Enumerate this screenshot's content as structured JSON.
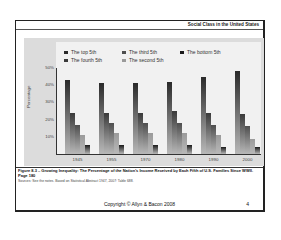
{
  "header": {
    "title": "Social Class in the United States"
  },
  "chart_data": {
    "type": "bar",
    "title": "",
    "xlabel": "",
    "ylabel": "Percentage",
    "ylim": [
      0,
      50
    ],
    "yticks": [
      "10%",
      "20%",
      "30%",
      "40%",
      "50%"
    ],
    "categories": [
      "1945",
      "1955",
      "1970",
      "1980",
      "1990",
      "2000"
    ],
    "legend_position": "top",
    "series": [
      {
        "name": "The top 5th",
        "color": "#2a2a2a",
        "values": [
          43,
          41,
          41,
          42,
          45,
          48
        ]
      },
      {
        "name": "The fourth 5th",
        "color": "#3a3a3a",
        "values": [
          24,
          24,
          24,
          25,
          24,
          23
        ]
      },
      {
        "name": "The third 5th",
        "color": "#4e4e4e",
        "values": [
          17,
          18,
          18,
          18,
          17,
          16
        ]
      },
      {
        "name": "The second 5th",
        "color": "#9a9a9a",
        "values": [
          11,
          12,
          12,
          12,
          11,
          9
        ]
      },
      {
        "name": "The bottom 5th",
        "color": "#1a1a1a",
        "values": [
          5,
          5,
          5,
          5,
          4,
          4
        ]
      }
    ]
  },
  "legend": [
    {
      "label": "The top 5th",
      "color": "#2a2a2a"
    },
    {
      "label": "The third 5th",
      "color": "#4e4e4e"
    },
    {
      "label": "The bottom 5th",
      "color": "#1a1a1a"
    },
    {
      "label": "The fourth 5th",
      "color": "#3a3a3a"
    },
    {
      "label": "The second 5th",
      "color": "#9a9a9a"
    }
  ],
  "caption": {
    "text": "Figure 8.3 – Growing Inequality: The Percentage of the Nation's Income Received by Each Fifth of U.S. Families Since WWII.",
    "page": "Page 180",
    "note": "Sources: See the notes. Based on Statistical Abstract 1947, 2007: Table 688."
  },
  "footer": {
    "copyright": "Copyright © Allyn & Bacon 2008",
    "page_number": "4"
  }
}
